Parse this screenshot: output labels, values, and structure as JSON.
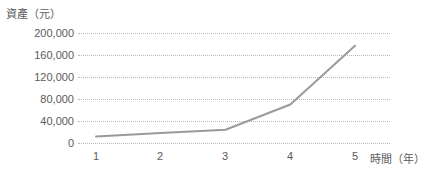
{
  "chart_data": {
    "type": "line",
    "title": "",
    "ylabel": "資產（元）",
    "xlabel": "時間（年）",
    "x": [
      1,
      2,
      3,
      4,
      5
    ],
    "categories": [
      "1",
      "2",
      "3",
      "4",
      "5"
    ],
    "values": [
      12000,
      18000,
      24000,
      70000,
      177000
    ],
    "series": [
      {
        "name": "資產",
        "values": [
          12000,
          18000,
          24000,
          70000,
          177000
        ],
        "color": "#9a9a9a"
      }
    ],
    "ylim": [
      0,
      200000
    ],
    "xlim": [
      1,
      5
    ],
    "yticks": [
      0,
      40000,
      80000,
      120000,
      160000,
      200000
    ],
    "ytick_labels": [
      "0",
      "40,000",
      "80,000",
      "120,000",
      "160,000",
      "200,000"
    ],
    "xtick_labels": [
      "1",
      "2",
      "3",
      "4",
      "5"
    ],
    "grid": true,
    "grid_style": "dotted",
    "grid_color": "#b9b9b9",
    "legend": "none",
    "line_color": "#9a9a9a",
    "line_width": 2,
    "text_color": "#5a5a5a",
    "background": "#ffffff"
  },
  "axes": {
    "y_title": "資產（元）",
    "x_title": "時間（年）"
  }
}
